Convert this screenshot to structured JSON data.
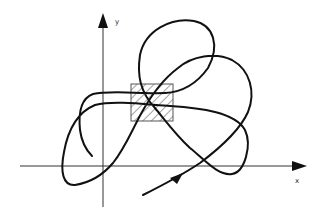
{
  "diagram": {
    "type": "trajectory in x-y plane",
    "axes": {
      "x_label": "x",
      "y_label": "y"
    },
    "region": {
      "shape": "rectangle",
      "fill": "hatched"
    },
    "curve": {
      "direction_arrow": true
    }
  }
}
